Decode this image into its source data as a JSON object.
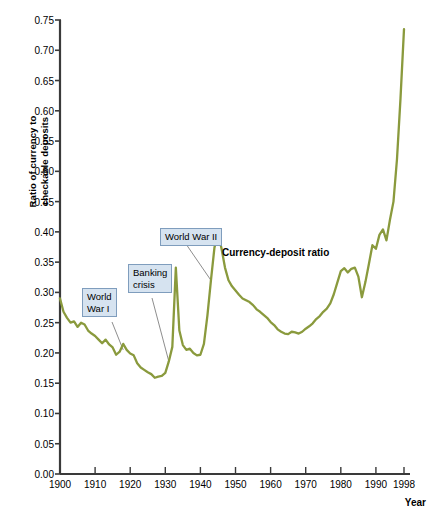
{
  "chart_data": {
    "type": "line",
    "title": "",
    "xlabel": "Year",
    "ylabel": "Ratio of currency to checkable deposits",
    "ylabel_line1": "Ratio of currency to",
    "ylabel_line2": "checkable deposits",
    "xlim": [
      1900,
      1998
    ],
    "ylim": [
      0.0,
      0.75
    ],
    "grid": false,
    "legend_position": "inline-label",
    "line_color": "#8a9a3d",
    "callout_fill": "#d6e3f0",
    "callout_border": "#7f9dbd",
    "leader_color": "#808080",
    "axis_color": "#3a3a3a",
    "yticks": [
      "0.00",
      "0.05",
      "0.10",
      "0.15",
      "0.20",
      "0.25",
      "0.30",
      "0.35",
      "0.40",
      "0.45",
      "0.50",
      "0.55",
      "0.60",
      "0.65",
      "0.70",
      "0.75"
    ],
    "ytick_values": [
      0.0,
      0.05,
      0.1,
      0.15,
      0.2,
      0.25,
      0.3,
      0.35,
      0.4,
      0.45,
      0.5,
      0.55,
      0.6,
      0.65,
      0.7,
      0.75
    ],
    "xticks": [
      "1900",
      "1910",
      "1920",
      "1930",
      "1940",
      "1950",
      "1960",
      "1970",
      "1980",
      "1990",
      "1998"
    ],
    "xtick_values": [
      1900,
      1910,
      1920,
      1930,
      1940,
      1950,
      1960,
      1970,
      1980,
      1990,
      1998
    ],
    "series": [
      {
        "name": "Currency-deposit ratio",
        "x": [
          1900,
          1901,
          1902,
          1903,
          1904,
          1905,
          1906,
          1907,
          1908,
          1909,
          1910,
          1911,
          1912,
          1913,
          1914,
          1915,
          1916,
          1917,
          1918,
          1919,
          1920,
          1921,
          1922,
          1923,
          1924,
          1925,
          1926,
          1927,
          1928,
          1929,
          1930,
          1931,
          1932,
          1933,
          1934,
          1935,
          1936,
          1937,
          1938,
          1939,
          1940,
          1941,
          1942,
          1943,
          1944,
          1945,
          1946,
          1947,
          1948,
          1949,
          1950,
          1951,
          1952,
          1953,
          1954,
          1955,
          1956,
          1957,
          1958,
          1959,
          1960,
          1961,
          1962,
          1963,
          1964,
          1965,
          1966,
          1967,
          1968,
          1969,
          1970,
          1971,
          1972,
          1973,
          1974,
          1975,
          1976,
          1977,
          1978,
          1979,
          1980,
          1981,
          1982,
          1983,
          1984,
          1985,
          1986,
          1987,
          1988,
          1989,
          1990,
          1991,
          1992,
          1993,
          1994,
          1995,
          1996,
          1997,
          1998
        ],
        "values": [
          0.29,
          0.268,
          0.258,
          0.25,
          0.252,
          0.243,
          0.25,
          0.247,
          0.237,
          0.232,
          0.228,
          0.222,
          0.216,
          0.222,
          0.214,
          0.209,
          0.197,
          0.202,
          0.215,
          0.205,
          0.199,
          0.196,
          0.183,
          0.176,
          0.172,
          0.168,
          0.165,
          0.159,
          0.161,
          0.162,
          0.167,
          0.186,
          0.21,
          0.341,
          0.237,
          0.213,
          0.205,
          0.207,
          0.2,
          0.196,
          0.197,
          0.215,
          0.262,
          0.32,
          0.374,
          0.398,
          0.373,
          0.341,
          0.32,
          0.31,
          0.303,
          0.296,
          0.29,
          0.287,
          0.284,
          0.279,
          0.272,
          0.268,
          0.263,
          0.258,
          0.251,
          0.246,
          0.239,
          0.235,
          0.232,
          0.231,
          0.235,
          0.234,
          0.232,
          0.235,
          0.24,
          0.244,
          0.249,
          0.256,
          0.261,
          0.268,
          0.273,
          0.282,
          0.297,
          0.316,
          0.335,
          0.34,
          0.333,
          0.339,
          0.341,
          0.326,
          0.292,
          0.317,
          0.347,
          0.378,
          0.372,
          0.395,
          0.404,
          0.386,
          0.42,
          0.45,
          0.52,
          0.62,
          0.735
        ]
      }
    ],
    "annotations": [
      {
        "id": "ww1",
        "label": "World\nWar I",
        "target_year": 1918,
        "target_value": 0.205
      },
      {
        "id": "bank",
        "label": "Banking\ncrisis",
        "target_year": 1931,
        "target_value": 0.186
      },
      {
        "id": "ww2",
        "label": "World War II",
        "target_year": 1943,
        "target_value": 0.32
      }
    ],
    "inline_series_label": "Currency-deposit ratio"
  }
}
